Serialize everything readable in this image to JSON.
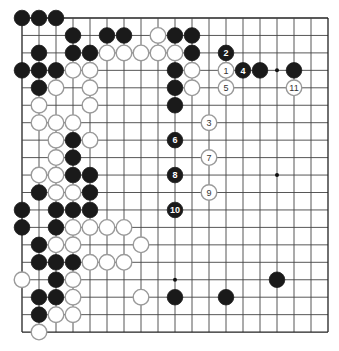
{
  "board": {
    "size": 19,
    "origin_x": 22,
    "origin_y": 18,
    "spacing_x": 17,
    "spacing_y": 17.45,
    "stone_radius": 7.8,
    "colors": {
      "black": "#1a1a1a",
      "white": "#ffffff",
      "white_outline": "#9a9a9a",
      "line": "#444444"
    }
  },
  "star_points": [
    [
      15,
      3
    ],
    [
      9,
      15
    ],
    [
      15,
      9
    ]
  ],
  "stones": [
    {
      "c": 0,
      "r": 0,
      "color": "black"
    },
    {
      "c": 1,
      "r": 0,
      "color": "black"
    },
    {
      "c": 2,
      "r": 0,
      "color": "black"
    },
    {
      "c": 3,
      "r": 1,
      "color": "black"
    },
    {
      "c": 5,
      "r": 1,
      "color": "black"
    },
    {
      "c": 6,
      "r": 1,
      "color": "black"
    },
    {
      "c": 8,
      "r": 1,
      "color": "white"
    },
    {
      "c": 9,
      "r": 1,
      "color": "black"
    },
    {
      "c": 10,
      "r": 1,
      "color": "black"
    },
    {
      "c": 1,
      "r": 2,
      "color": "black"
    },
    {
      "c": 3,
      "r": 2,
      "color": "black"
    },
    {
      "c": 4,
      "r": 2,
      "color": "black"
    },
    {
      "c": 5,
      "r": 2,
      "color": "white"
    },
    {
      "c": 6,
      "r": 2,
      "color": "white"
    },
    {
      "c": 7,
      "r": 2,
      "color": "white"
    },
    {
      "c": 8,
      "r": 2,
      "color": "white"
    },
    {
      "c": 9,
      "r": 2,
      "color": "white"
    },
    {
      "c": 10,
      "r": 2,
      "color": "black"
    },
    {
      "c": 12,
      "r": 2,
      "color": "black",
      "label": "2"
    },
    {
      "c": 0,
      "r": 3,
      "color": "black"
    },
    {
      "c": 1,
      "r": 3,
      "color": "black"
    },
    {
      "c": 2,
      "r": 3,
      "color": "black"
    },
    {
      "c": 3,
      "r": 3,
      "color": "white"
    },
    {
      "c": 4,
      "r": 3,
      "color": "white"
    },
    {
      "c": 9,
      "r": 3,
      "color": "black"
    },
    {
      "c": 10,
      "r": 3,
      "color": "white"
    },
    {
      "c": 12,
      "r": 3,
      "color": "white",
      "label": "1"
    },
    {
      "c": 13,
      "r": 3,
      "color": "black",
      "label": "4"
    },
    {
      "c": 14,
      "r": 3,
      "color": "black"
    },
    {
      "c": 16,
      "r": 3,
      "color": "black"
    },
    {
      "c": 1,
      "r": 4,
      "color": "black"
    },
    {
      "c": 2,
      "r": 4,
      "color": "white"
    },
    {
      "c": 4,
      "r": 4,
      "color": "white"
    },
    {
      "c": 9,
      "r": 4,
      "color": "black"
    },
    {
      "c": 10,
      "r": 4,
      "color": "white"
    },
    {
      "c": 12,
      "r": 4,
      "color": "white",
      "label": "5"
    },
    {
      "c": 16,
      "r": 4,
      "color": "white",
      "label": "11"
    },
    {
      "c": 1,
      "r": 5,
      "color": "white"
    },
    {
      "c": 4,
      "r": 5,
      "color": "white"
    },
    {
      "c": 9,
      "r": 5,
      "color": "black"
    },
    {
      "c": 1,
      "r": 6,
      "color": "white"
    },
    {
      "c": 2,
      "r": 6,
      "color": "white"
    },
    {
      "c": 3,
      "r": 6,
      "color": "white"
    },
    {
      "c": 11,
      "r": 6,
      "color": "white",
      "label": "3"
    },
    {
      "c": 2,
      "r": 7,
      "color": "white"
    },
    {
      "c": 3,
      "r": 7,
      "color": "black"
    },
    {
      "c": 4,
      "r": 7,
      "color": "white"
    },
    {
      "c": 9,
      "r": 7,
      "color": "black",
      "label": "6"
    },
    {
      "c": 2,
      "r": 8,
      "color": "white"
    },
    {
      "c": 3,
      "r": 8,
      "color": "black"
    },
    {
      "c": 11,
      "r": 8,
      "color": "white",
      "label": "7"
    },
    {
      "c": 1,
      "r": 9,
      "color": "white"
    },
    {
      "c": 2,
      "r": 9,
      "color": "white"
    },
    {
      "c": 3,
      "r": 9,
      "color": "black"
    },
    {
      "c": 4,
      "r": 9,
      "color": "black"
    },
    {
      "c": 9,
      "r": 9,
      "color": "black",
      "label": "8"
    },
    {
      "c": 1,
      "r": 10,
      "color": "black"
    },
    {
      "c": 2,
      "r": 10,
      "color": "white"
    },
    {
      "c": 3,
      "r": 10,
      "color": "white"
    },
    {
      "c": 4,
      "r": 10,
      "color": "black"
    },
    {
      "c": 11,
      "r": 10,
      "color": "white",
      "label": "9"
    },
    {
      "c": 0,
      "r": 11,
      "color": "black"
    },
    {
      "c": 2,
      "r": 11,
      "color": "black"
    },
    {
      "c": 3,
      "r": 11,
      "color": "black"
    },
    {
      "c": 4,
      "r": 11,
      "color": "black"
    },
    {
      "c": 9,
      "r": 11,
      "color": "black",
      "label": "10"
    },
    {
      "c": 0,
      "r": 12,
      "color": "black"
    },
    {
      "c": 2,
      "r": 12,
      "color": "black"
    },
    {
      "c": 3,
      "r": 12,
      "color": "white"
    },
    {
      "c": 4,
      "r": 12,
      "color": "white"
    },
    {
      "c": 5,
      "r": 12,
      "color": "white"
    },
    {
      "c": 6,
      "r": 12,
      "color": "white"
    },
    {
      "c": 1,
      "r": 13,
      "color": "black"
    },
    {
      "c": 2,
      "r": 13,
      "color": "white"
    },
    {
      "c": 3,
      "r": 13,
      "color": "white"
    },
    {
      "c": 7,
      "r": 13,
      "color": "white"
    },
    {
      "c": 1,
      "r": 14,
      "color": "black"
    },
    {
      "c": 2,
      "r": 14,
      "color": "black"
    },
    {
      "c": 3,
      "r": 14,
      "color": "black"
    },
    {
      "c": 4,
      "r": 14,
      "color": "white"
    },
    {
      "c": 5,
      "r": 14,
      "color": "white"
    },
    {
      "c": 6,
      "r": 14,
      "color": "white"
    },
    {
      "c": 0,
      "r": 15,
      "color": "white"
    },
    {
      "c": 2,
      "r": 15,
      "color": "black"
    },
    {
      "c": 3,
      "r": 15,
      "color": "white"
    },
    {
      "c": 15,
      "r": 15,
      "color": "black"
    },
    {
      "c": 1,
      "r": 16,
      "color": "black"
    },
    {
      "c": 2,
      "r": 16,
      "color": "black"
    },
    {
      "c": 3,
      "r": 16,
      "color": "white"
    },
    {
      "c": 7,
      "r": 16,
      "color": "white"
    },
    {
      "c": 9,
      "r": 16,
      "color": "black"
    },
    {
      "c": 12,
      "r": 16,
      "color": "black"
    },
    {
      "c": 1,
      "r": 17,
      "color": "black"
    },
    {
      "c": 2,
      "r": 17,
      "color": "white"
    },
    {
      "c": 3,
      "r": 17,
      "color": "white"
    },
    {
      "c": 1,
      "r": 18,
      "color": "white"
    }
  ]
}
